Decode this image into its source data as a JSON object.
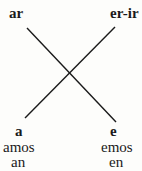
{
  "diagram": {
    "top_left": "ar",
    "top_right": "er-ir",
    "bottom_left": [
      "a",
      "amos",
      "an"
    ],
    "bottom_right": [
      "e",
      "emos",
      "en"
    ]
  },
  "colors": {
    "line": "#1a1a1a",
    "background": "#fdfdfb"
  }
}
